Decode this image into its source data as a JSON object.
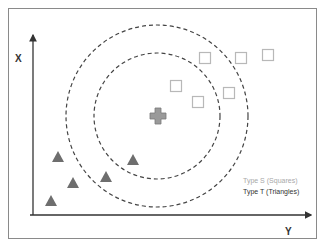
{
  "diagram": {
    "type": "knn_classification",
    "axes": {
      "vertical_label": "X",
      "horizontal_label": "Y"
    },
    "legend": [
      {
        "label": "Type S (Squares)",
        "color": "#a8a8a8"
      },
      {
        "label": "Type T (Triangles)",
        "color": "#333333"
      }
    ],
    "query_point": {
      "shape": "plus",
      "x": 158,
      "y": 116,
      "color": "#9a9a9a"
    },
    "circles": [
      {
        "name": "inner",
        "cx": 157,
        "cy": 116,
        "r": 63
      },
      {
        "name": "outer",
        "cx": 157,
        "cy": 116,
        "r": 91
      }
    ],
    "squares": [
      {
        "x": 205,
        "y": 58
      },
      {
        "x": 241,
        "y": 58
      },
      {
        "x": 268,
        "y": 55
      },
      {
        "x": 176,
        "y": 86
      },
      {
        "x": 229,
        "y": 93
      },
      {
        "x": 198,
        "y": 102
      }
    ],
    "triangles": [
      {
        "x": 58,
        "y": 157
      },
      {
        "x": 133,
        "y": 160
      },
      {
        "x": 106,
        "y": 177
      },
      {
        "x": 73,
        "y": 183
      },
      {
        "x": 51,
        "y": 201
      }
    ],
    "colors": {
      "square_stroke": "#b8b8b8",
      "triangle_fill": "#6e6e6e",
      "circle_stroke": "#444444",
      "axis": "#333333"
    }
  }
}
